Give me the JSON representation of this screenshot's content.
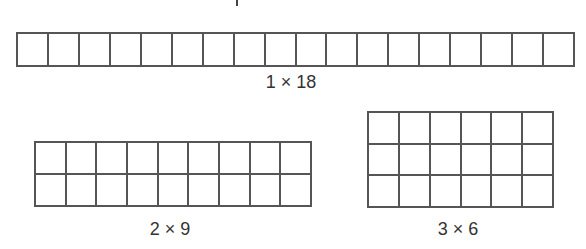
{
  "diagram": {
    "arrays": [
      {
        "rows": 1,
        "cols": 18,
        "label": "1 × 18",
        "cell_px": 31
      },
      {
        "rows": 2,
        "cols": 9,
        "label": "2 × 9",
        "cell_px": 31
      },
      {
        "rows": 3,
        "cols": 6,
        "label": "3 × 6",
        "cell_px": 31
      }
    ],
    "line_color": "#555555",
    "label_color": "#333333"
  }
}
